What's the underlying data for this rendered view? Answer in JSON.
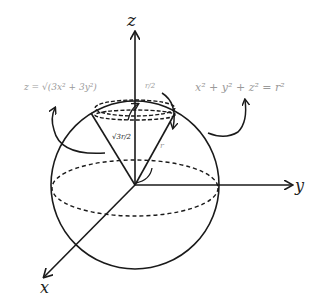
{
  "diagram": {
    "axes": {
      "z": "z",
      "y": "y",
      "x": "x"
    },
    "labels": {
      "cone_equation": "z = √(3x² + 3y²)",
      "sphere_equation": "x² + y² + z² = r²",
      "half_r": "r/2",
      "cone_height": "√3r/2",
      "radius": "r"
    },
    "colors": {
      "stroke": "#1a1a1a",
      "faint_text": "#9a9a9a",
      "background": "#ffffff"
    }
  }
}
